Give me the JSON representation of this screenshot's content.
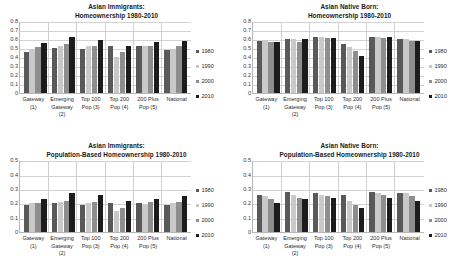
{
  "legend": {
    "position": "right",
    "entries": [
      {
        "label": "1980",
        "color": "#595959",
        "key": "c1980"
      },
      {
        "label": "1990",
        "color": "#c9c9c9",
        "key": "c1990"
      },
      {
        "label": "2000",
        "color": "#8e8e8e",
        "key": "c2000"
      },
      {
        "label": "2010",
        "color": "#1c1c1c",
        "key": "c2010"
      }
    ]
  },
  "categories": [
    {
      "line1": "Gateway",
      "line2": "(1)",
      "line3": ""
    },
    {
      "line1": "Emerging",
      "line2": "Gateway",
      "line3": "(2)"
    },
    {
      "line1": "Top 100",
      "line2": "Pop (3)",
      "line3": ""
    },
    {
      "line1": "Top 200",
      "line2": "Pop (4)",
      "line3": ""
    },
    {
      "line1": "200 Plus",
      "line2": "Pop (5)",
      "line3": ""
    },
    {
      "line1": "National",
      "line2": "",
      "line3": ""
    }
  ],
  "charts": [
    {
      "id": "asian-immigrants-homeownership",
      "title_line1": "Asian Immigrants:",
      "title_line2": "Homeownership 1980-2010",
      "yticks": [
        "0.8",
        "0.7",
        "0.6",
        "0.5",
        "0.4",
        "0.3",
        "0.2",
        "0.1",
        "0"
      ],
      "chart_data": {
        "type": "bar",
        "title": "Asian Immigrants: Homeownership 1980-2010",
        "xlabel": "",
        "ylabel": "",
        "ylim": [
          0,
          0.8
        ],
        "ytick_step": 0.1,
        "grid": true,
        "legend_position": "right",
        "categories": [
          "Gateway (1)",
          "Emerging Gateway (2)",
          "Top 100 Pop (3)",
          "Top 200 Pop (4)",
          "200 Plus Pop (5)",
          "National"
        ],
        "series": [
          {
            "name": "1980",
            "values": [
              0.46,
              0.5,
              0.49,
              0.52,
              0.53,
              0.48
            ]
          },
          {
            "name": "1990",
            "values": [
              0.49,
              0.52,
              0.52,
              0.4,
              0.52,
              0.49
            ]
          },
          {
            "name": "2000",
            "values": [
              0.51,
              0.55,
              0.53,
              0.46,
              0.52,
              0.52
            ]
          },
          {
            "name": "2010",
            "values": [
              0.56,
              0.63,
              0.59,
              0.53,
              0.57,
              0.58
            ]
          }
        ]
      }
    },
    {
      "id": "asian-native-born-homeownership",
      "title_line1": "Asian Native Born:",
      "title_line2": "Homeownership 1980-2010",
      "yticks": [
        "0.8",
        "0.7",
        "0.6",
        "0.5",
        "0.4",
        "0.3",
        "0.2",
        "0.1",
        "0"
      ],
      "chart_data": {
        "type": "bar",
        "title": "Asian Native Born: Homeownership 1980-2010",
        "xlabel": "",
        "ylabel": "",
        "ylim": [
          0,
          0.8
        ],
        "ytick_step": 0.1,
        "grid": true,
        "legend_position": "right",
        "categories": [
          "Gateway (1)",
          "Emerging Gateway (2)",
          "Top 100 Pop (3)",
          "Top 200 Pop (4)",
          "200 Plus Pop (5)",
          "National"
        ],
        "series": [
          {
            "name": "1980",
            "values": [
              0.58,
              0.6,
              0.62,
              0.55,
              0.63,
              0.6
            ]
          },
          {
            "name": "1990",
            "values": [
              0.59,
              0.6,
              0.63,
              0.51,
              0.62,
              0.6
            ]
          },
          {
            "name": "2000",
            "values": [
              0.57,
              0.57,
              0.61,
              0.47,
              0.61,
              0.58
            ]
          },
          {
            "name": "2010",
            "values": [
              0.57,
              0.6,
              0.61,
              0.41,
              0.62,
              0.58
            ]
          }
        ]
      }
    },
    {
      "id": "asian-immigrants-population-based",
      "title_line1": "Asian Immigrants:",
      "title_line2": "Population-Based Homeownership 1980-2010",
      "yticks": [
        "0.5",
        "0.4",
        "0.3",
        "0.2",
        "0.1",
        "0"
      ],
      "chart_data": {
        "type": "bar",
        "title": "Asian Immigrants: Population-Based Homeownership 1980-2010",
        "xlabel": "",
        "ylabel": "",
        "ylim": [
          0,
          0.5
        ],
        "ytick_step": 0.1,
        "grid": true,
        "legend_position": "right",
        "categories": [
          "Gateway (1)",
          "Emerging Gateway (2)",
          "Top 100 Pop (3)",
          "Top 200 Pop (4)",
          "200 Plus Pop (5)",
          "National"
        ],
        "series": [
          {
            "name": "1980",
            "values": [
              0.19,
              0.2,
              0.19,
              0.2,
              0.2,
              0.19
            ]
          },
          {
            "name": "1990",
            "values": [
              0.2,
              0.21,
              0.2,
              0.15,
              0.19,
              0.2
            ]
          },
          {
            "name": "2000",
            "values": [
              0.2,
              0.22,
              0.21,
              0.17,
              0.21,
              0.21
            ]
          },
          {
            "name": "2010",
            "values": [
              0.23,
              0.27,
              0.26,
              0.22,
              0.23,
              0.25
            ]
          }
        ]
      }
    },
    {
      "id": "asian-native-born-population-based",
      "title_line1": "Asian Native Born:",
      "title_line2": "Population-Based Homeownership 1980-2010",
      "yticks": [
        "0.5",
        "0.4",
        "0.3",
        "0.2",
        "0.1",
        "0"
      ],
      "chart_data": {
        "type": "bar",
        "title": "Asian Native Born: Population-Based Homeownership 1980-2010",
        "xlabel": "",
        "ylabel": "",
        "ylim": [
          0,
          0.5
        ],
        "ytick_step": 0.1,
        "grid": true,
        "legend_position": "right",
        "categories": [
          "Gateway (1)",
          "Emerging Gateway (2)",
          "Top 100 Pop (3)",
          "Top 200 Pop (4)",
          "200 Plus Pop (5)",
          "National"
        ],
        "series": [
          {
            "name": "1980",
            "values": [
              0.26,
              0.28,
              0.27,
              0.26,
              0.28,
              0.27
            ]
          },
          {
            "name": "1990",
            "values": [
              0.25,
              0.26,
              0.26,
              0.22,
              0.27,
              0.27
            ]
          },
          {
            "name": "2000",
            "values": [
              0.23,
              0.24,
              0.25,
              0.19,
              0.26,
              0.25
            ]
          },
          {
            "name": "2010",
            "values": [
              0.2,
              0.23,
              0.24,
              0.17,
              0.24,
              0.22
            ]
          }
        ]
      }
    }
  ]
}
